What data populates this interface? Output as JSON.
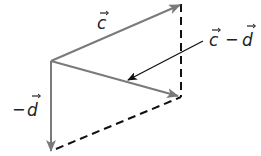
{
  "diagram": {
    "type": "vector-subtraction-parallelogram",
    "colors": {
      "vector": "#7a7a7a",
      "dashed": "#111111",
      "pointer": "#111111",
      "text": "#222222",
      "background": "#ffffff"
    },
    "origin": [
      51,
      61
    ],
    "vectors": [
      {
        "name": "c",
        "label": "c",
        "from": [
          51,
          61
        ],
        "to": [
          181,
          4
        ]
      },
      {
        "name": "minus-d",
        "label": "−d",
        "from": [
          51,
          61
        ],
        "to": [
          51,
          150
        ]
      },
      {
        "name": "c-minus-d",
        "label": "c − d",
        "from": [
          51,
          61
        ],
        "to": [
          181,
          97
        ]
      }
    ],
    "dashed_lines": [
      {
        "from": [
          181,
          4
        ],
        "to": [
          181,
          97
        ]
      },
      {
        "from": [
          51,
          150
        ],
        "to": [
          181,
          97
        ]
      }
    ],
    "labels": {
      "c": {
        "base": "c",
        "prefix": ""
      },
      "minus_d": {
        "prefix": "−",
        "base": "d"
      },
      "c_minus_d": {
        "left": "c",
        "op": "−",
        "right": "d"
      }
    },
    "pointer": {
      "from": [
        203,
        41
      ],
      "to": [
        128,
        80
      ]
    }
  }
}
